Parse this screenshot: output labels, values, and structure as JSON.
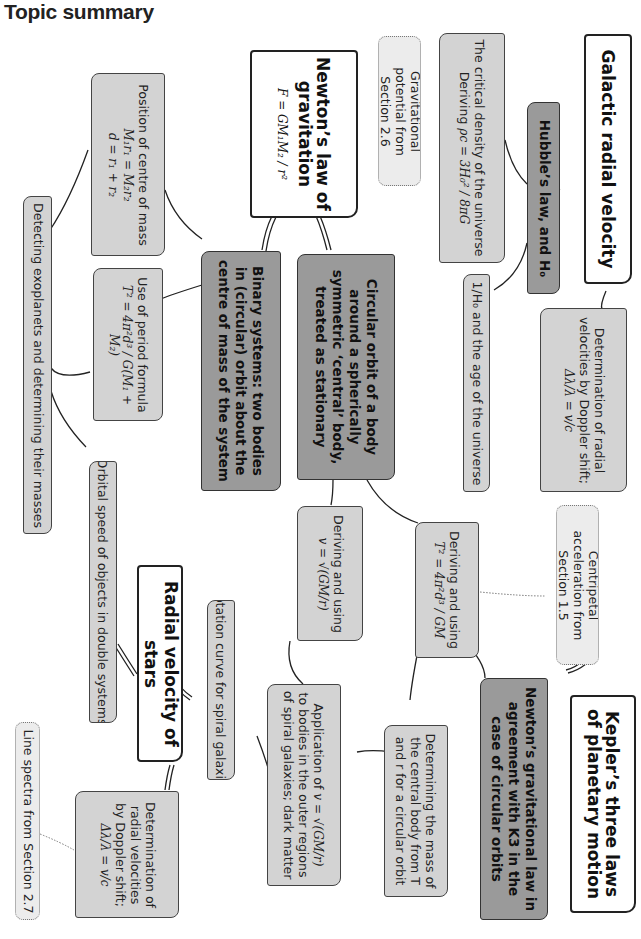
{
  "page": {
    "title": "Topic summary"
  },
  "colors": {
    "main_fill": "#ffffff",
    "dark_fill": "#9a9a9a",
    "light_fill": "#d3d3d3",
    "ref_fill": "#ececec",
    "line": "#222222"
  },
  "main_topics": {
    "galactic": "Galactic radial velocity",
    "newton_law": "Newton’s law of gravitation",
    "newton_eq": "F = GM₁M₂ / r²",
    "radial_stars": "Radial velocity of stars",
    "kepler": "Kepler’s three laws of planetary motion"
  },
  "subtopics": {
    "hubble": "Hubble’s law, and H₀",
    "circular_orbit": "Circular orbit of a body around a spherically symmetric ‘central’ body, treated as stationary",
    "binary": "Binary systems: two bodies in (circular) orbit about the centre of mass of the system",
    "newton_k3": "Newton’s gravitational law in agreement with K3 in the case of circular orbits"
  },
  "details": {
    "critical_density": {
      "line1": "The critical density of the universe",
      "line2": "Deriving",
      "eq": "ρc = 3H₀² / 8πG"
    },
    "doppler_galactic": {
      "text": "Determination of radial velocities by Doppler shift;",
      "eq": "Δλ/λ = v/c"
    },
    "hubble_age": "1/H₀ and the age of the universe",
    "centre_mass": {
      "text": "Position of centre of mass",
      "eq1": "M₁r₁ = M₂r₂",
      "eq2": "d = r₁ + r₂"
    },
    "period_formula": {
      "text": "Use of period formula",
      "eq": "T² = 4π²d³ / G(M₁ + M₂)"
    },
    "exoplanets": "Detecting exoplanets and determining their masses",
    "orbital_speed": "Orbital speed of objects in double systems",
    "deriving_T2": {
      "text": "Deriving and using",
      "eq": "T² = 4π²d³ / GM"
    },
    "deriving_v": {
      "text": "Deriving and using",
      "eq": "v = √(GM/r)"
    },
    "rotation_curve": "Rotation curve for spiral galaxies",
    "application_v": {
      "text1": "Application of",
      "eq": "v = √(GM/r)",
      "text2": "to bodies in the outer regions of spiral galaxies; dark matter"
    },
    "mass_central": "Determining the mass of the central body from T and r for a circular orbit",
    "doppler_stars": {
      "text": "Determination of radial velocities by Doppler shift;",
      "eq": "Δλ/λ = v/c"
    }
  },
  "references": {
    "grav_potential": "Gravitational potential from Section 2.6",
    "centripetal": "Centripetal acceleration from Section 1.5",
    "line_spectra": "Line spectra from Section 2.7"
  }
}
